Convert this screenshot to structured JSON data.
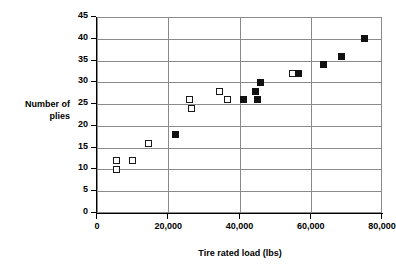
{
  "chart_data": {
    "type": "scatter",
    "title": "",
    "xlabel": "Tire rated load (lbs)",
    "ylabel_lines": [
      "Number of",
      "plies"
    ],
    "ylabel": "Number of plies",
    "xlim": [
      0,
      80000
    ],
    "ylim": [
      0,
      45
    ],
    "x_ticks": [
      0,
      20000,
      40000,
      60000,
      80000
    ],
    "x_tick_labels": [
      "0",
      "20,000",
      "40,000",
      "60,000",
      "80,000"
    ],
    "y_ticks": [
      0,
      5,
      10,
      15,
      20,
      25,
      30,
      35,
      40,
      45
    ],
    "y_tick_labels": [
      "0",
      "5",
      "10",
      "15",
      "20",
      "25",
      "30",
      "35",
      "40",
      "45"
    ],
    "grid": {
      "horizontal": true,
      "vertical": true
    },
    "legend": null,
    "marker_colors": {
      "open": "#ffffff",
      "filled": "#111111",
      "edge": "#1a1a1a"
    },
    "series": [
      {
        "name": "open-square",
        "marker": "open",
        "points": [
          {
            "x": 5500,
            "y": 12
          },
          {
            "x": 5500,
            "y": 10
          },
          {
            "x": 10000,
            "y": 12
          },
          {
            "x": 14500,
            "y": 16
          },
          {
            "x": 26000,
            "y": 26
          },
          {
            "x": 26500,
            "y": 24
          },
          {
            "x": 34500,
            "y": 28
          },
          {
            "x": 36500,
            "y": 26
          },
          {
            "x": 55000,
            "y": 32
          }
        ]
      },
      {
        "name": "filled-square",
        "marker": "filled",
        "points": [
          {
            "x": 22000,
            "y": 18
          },
          {
            "x": 41000,
            "y": 26
          },
          {
            "x": 44500,
            "y": 28
          },
          {
            "x": 45000,
            "y": 26
          },
          {
            "x": 46000,
            "y": 30
          },
          {
            "x": 56500,
            "y": 32
          },
          {
            "x": 63500,
            "y": 34
          },
          {
            "x": 68500,
            "y": 36
          },
          {
            "x": 75000,
            "y": 40
          }
        ]
      }
    ]
  }
}
